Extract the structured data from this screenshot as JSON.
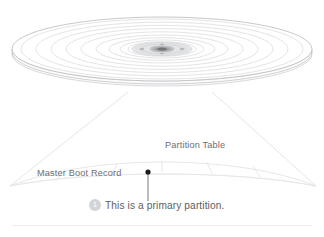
{
  "figure": {
    "background_color": "#ffffff"
  },
  "disk": {
    "name": "hard-disk-platter",
    "track_ring_count": 9,
    "stroke_color": "#cfd0d2",
    "hub_color": "#d8d9db",
    "spindle_color": "#9a9a9e"
  },
  "magnifier": {
    "name": "magnification-cone",
    "stroke_color": "#d9dadc",
    "sector_count": 6
  },
  "labels": {
    "master_boot_record": "Master Boot Record",
    "partition_table": "Partition Table"
  },
  "pointer": {
    "name": "callout-pointer",
    "dot_color": "#1b1b1b",
    "line_color": "#6a6a6e"
  },
  "caption": {
    "badge_number": "1",
    "text": "This is a primary partition.",
    "badge_color": "#d3d4d6",
    "text_color": "#5e5e62"
  },
  "footer": {
    "rule_color": "#ececed"
  }
}
